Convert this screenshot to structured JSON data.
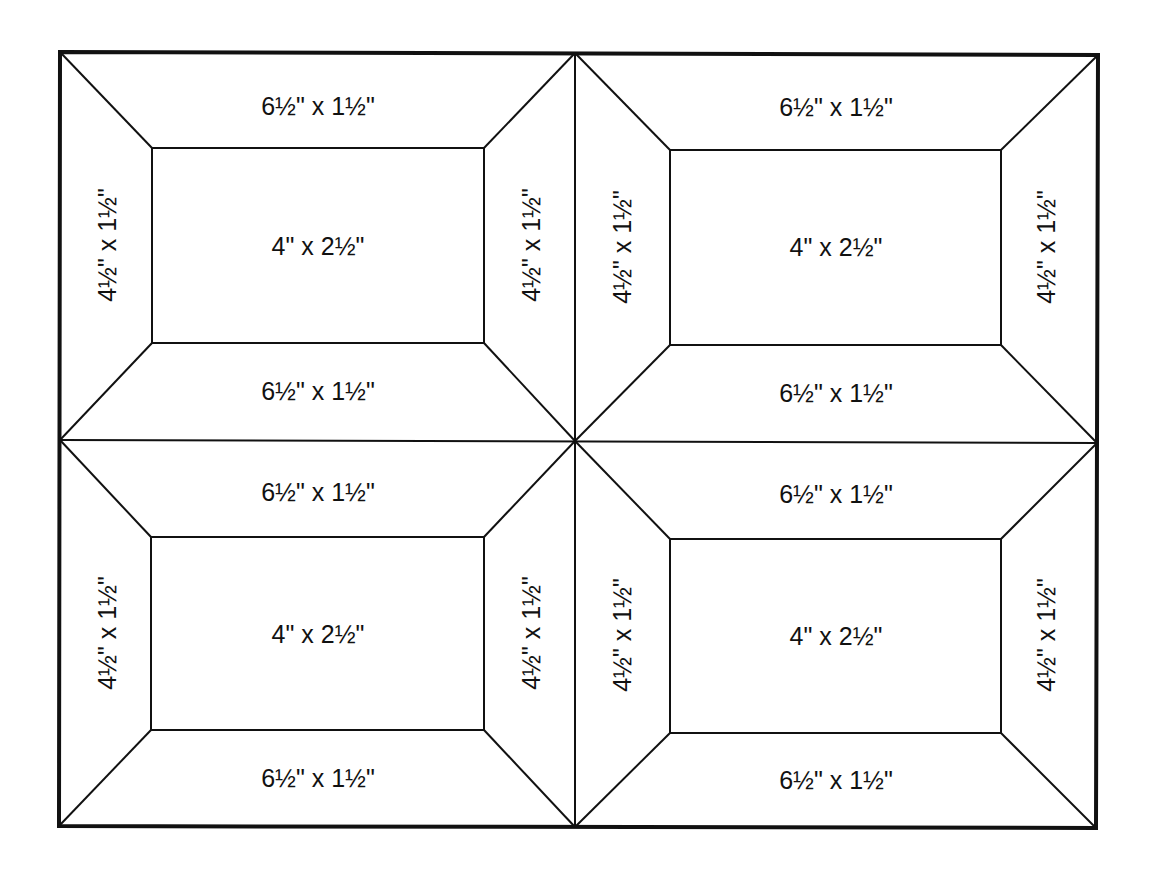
{
  "diagram": {
    "colors": {
      "line": "#111111",
      "background": "#ffffff"
    },
    "blocks": [
      {
        "position": "top-left",
        "top_strip": "6½\" x 1½\"",
        "bottom_strip": "6½\" x 1½\"",
        "left_strip": "4½\" x 1½\"",
        "right_strip": "4½\" x 1½\"",
        "center": "4\" x 2½\""
      },
      {
        "position": "top-right",
        "top_strip": "6½\" x 1½\"",
        "bottom_strip": "6½\" x 1½\"",
        "left_strip": "4½\" x 1½\"",
        "right_strip": "4½\" x 1½\"",
        "center": "4\" x 2½\""
      },
      {
        "position": "bottom-left",
        "top_strip": "6½\" x 1½\"",
        "bottom_strip": "6½\" x 1½\"",
        "left_strip": "4½\" x 1½\"",
        "right_strip": "4½\" x 1½\"",
        "center": "4\" x 2½\""
      },
      {
        "position": "bottom-right",
        "top_strip": "6½\" x 1½\"",
        "bottom_strip": "6½\" x 1½\"",
        "left_strip": "4½\" x 1½\"",
        "right_strip": "4½\" x 1½\"",
        "center": "4\" x 2½\""
      }
    ]
  }
}
